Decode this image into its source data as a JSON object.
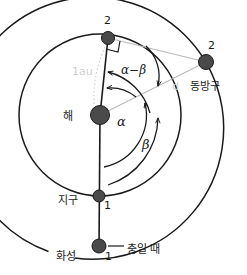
{
  "diagram": {
    "colors": {
      "orbit_stroke": "#1a1a1a",
      "body_fill": "#4a4a4a",
      "body_stroke": "#1a1a1a",
      "gray_line": "#b9b9b9",
      "faint_text": "#cfcfcf",
      "text": "#1a1a1a"
    },
    "labels": {
      "sun": "해",
      "earth": "지구",
      "mars": "화성",
      "eastern_quadrature": "동방구",
      "opposition": "충일 때",
      "earth_pos_1": "1",
      "earth_pos_2": "2",
      "mars_pos_1": "1",
      "mars_pos_2": "2",
      "one_au": "1au",
      "distance_d": "d",
      "angle_alpha": "α",
      "angle_beta": "β",
      "angle_alpha_minus_beta": "α−β"
    },
    "bodies": [
      {
        "name": "sun",
        "label": "해",
        "cx": 100,
        "cy": 115,
        "r": 9.5
      },
      {
        "name": "earth-position-2",
        "label": "2",
        "cx": 108,
        "cy": 38,
        "r": 6.5
      },
      {
        "name": "earth-position-1",
        "label": "1",
        "cx": 99,
        "cy": 196,
        "r": 6.0
      },
      {
        "name": "mars-position-2",
        "label": "2",
        "cx": 206,
        "cy": 62,
        "r": 7.5
      },
      {
        "name": "mars-position-1",
        "label": "1",
        "cx": 99,
        "cy": 246,
        "r": 7.0
      }
    ],
    "orbits": [
      {
        "name": "earth-orbit",
        "type": "circle",
        "cx": 100,
        "cy": 115,
        "r": 81
      },
      {
        "name": "mars-orbit",
        "type": "arc",
        "cx": 100,
        "cy": 115,
        "r": 131
      }
    ]
  }
}
